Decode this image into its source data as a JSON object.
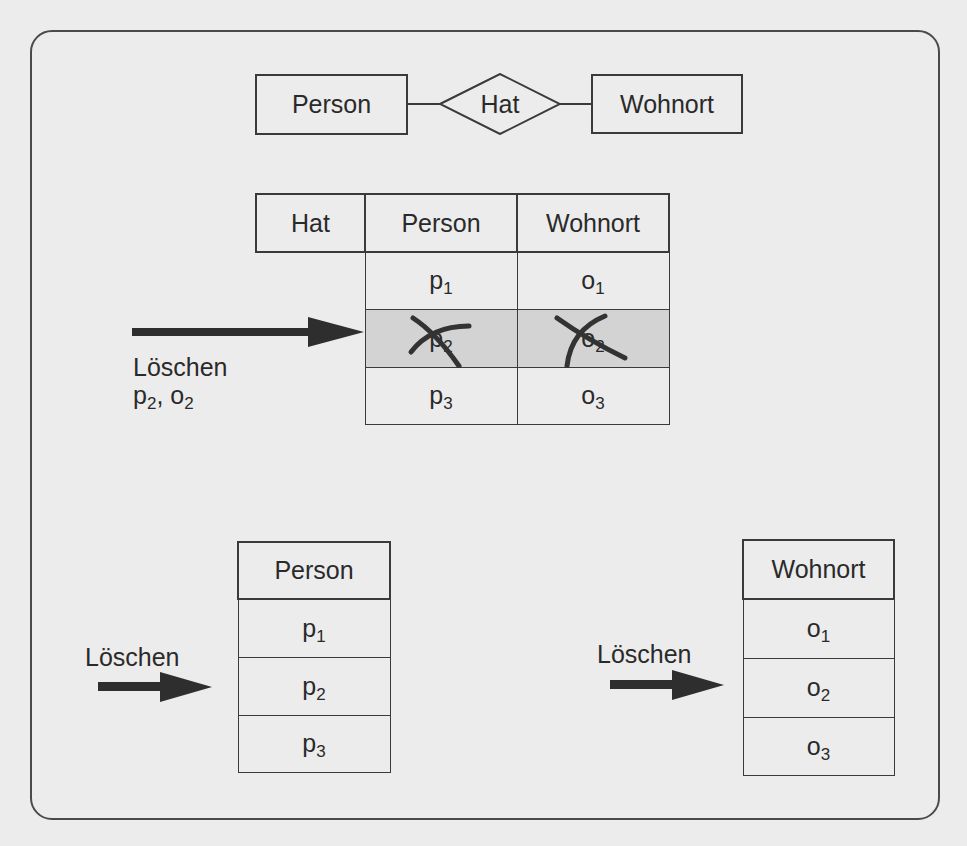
{
  "er_diagram": {
    "entity_left": "Person",
    "relationship": "Hat",
    "entity_right": "Wohnort"
  },
  "relationship_table": {
    "columns": [
      "Hat",
      "Person",
      "Wohnort"
    ],
    "rows": [
      {
        "person": "p",
        "person_sub": "1",
        "wohnort": "o",
        "wohnort_sub": "1",
        "deleted": false
      },
      {
        "person": "p",
        "person_sub": "2",
        "wohnort": "o",
        "wohnort_sub": "2",
        "deleted": true
      },
      {
        "person": "p",
        "person_sub": "3",
        "wohnort": "o",
        "wohnort_sub": "3",
        "deleted": false
      }
    ],
    "delete_action": {
      "label": "Löschen",
      "target_p": "p",
      "target_p_sub": "2",
      "separator": ", ",
      "target_o": "o",
      "target_o_sub": "2"
    },
    "highlight_color": "#d3d3d3"
  },
  "person_table": {
    "header": "Person",
    "rows": [
      {
        "value": "p",
        "sub": "1"
      },
      {
        "value": "p",
        "sub": "2"
      },
      {
        "value": "p",
        "sub": "3"
      }
    ],
    "delete_label": "Löschen"
  },
  "wohnort_table": {
    "header": "Wohnort",
    "rows": [
      {
        "value": "o",
        "sub": "1"
      },
      {
        "value": "o",
        "sub": "2"
      },
      {
        "value": "o",
        "sub": "3"
      }
    ],
    "delete_label": "Löschen"
  }
}
